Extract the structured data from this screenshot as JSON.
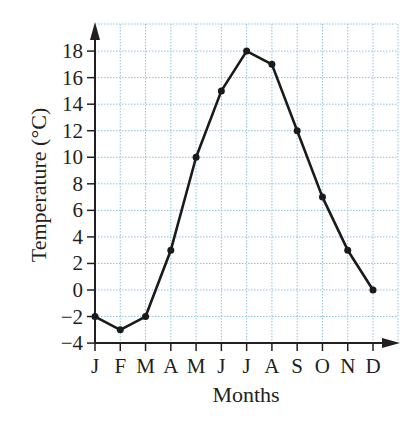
{
  "chart_data": {
    "type": "line",
    "title": "",
    "xlabel": "Months",
    "ylabel": "Temperature (°C)",
    "categories": [
      "J",
      "F",
      "M",
      "A",
      "M",
      "J",
      "J",
      "A",
      "S",
      "O",
      "N",
      "D"
    ],
    "values": [
      -2,
      -3,
      -2,
      3,
      10,
      15,
      18,
      17,
      12,
      7,
      3,
      0
    ],
    "series": [
      {
        "name": "Temperature",
        "values": [
          -2,
          -3,
          -2,
          3,
          10,
          15,
          18,
          17,
          12,
          7,
          3,
          0
        ]
      }
    ],
    "y_ticks": [
      -4,
      -2,
      0,
      2,
      4,
      6,
      8,
      10,
      12,
      14,
      16,
      18
    ],
    "ylim": [
      -4,
      19
    ],
    "grid": true,
    "legend": "none",
    "colors": {
      "line": "#1a1a1a",
      "grid": "#8fc3dc",
      "axis": "#231f20"
    }
  }
}
